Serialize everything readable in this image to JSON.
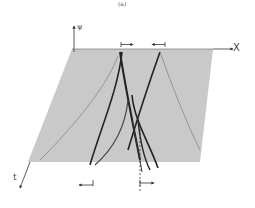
{
  "figure": {
    "panel_label": "(a)",
    "type": "3D waterfall plot (soliton collision)",
    "axes": {
      "vertical": "ψ",
      "horizontal": "X",
      "depth": "t"
    },
    "annotations": {
      "top_arrows": [
        "right-pointing bracket arrow",
        "left-pointing bracket arrow"
      ],
      "bottom_arrows": [
        "left-pointing bracket arrow",
        "right-pointing bracket arrow"
      ],
      "dashed_line": "vertical dashed reference line"
    },
    "colors": {
      "ink": "#222222",
      "stripe": "#555555",
      "background": "#ffffff"
    }
  }
}
